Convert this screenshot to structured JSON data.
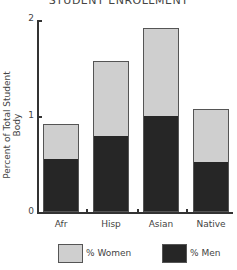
{
  "chart_data": {
    "type": "bar",
    "stacked": true,
    "title": "STUDENT ENROLLMENT",
    "xlabel": "",
    "ylabel": "Percent of Total Student Body",
    "ylim": [
      0,
      2
    ],
    "yticks": [
      "0",
      "1",
      "2"
    ],
    "categories": [
      "Afr",
      "Hisp",
      "Asian",
      "Native"
    ],
    "series": [
      {
        "name": "% Men",
        "color": "#262626",
        "values": [
          0.54,
          0.78,
          0.99,
          0.51
        ]
      },
      {
        "name": "% Women",
        "color": "#cfcfcf",
        "values": [
          0.38,
          0.79,
          0.93,
          0.56
        ]
      }
    ],
    "totals": [
      0.92,
      1.57,
      1.92,
      1.07
    ],
    "grid": false,
    "legend_position": "bottom"
  },
  "legend": {
    "women_label": "% Women",
    "men_label": "% Men"
  }
}
